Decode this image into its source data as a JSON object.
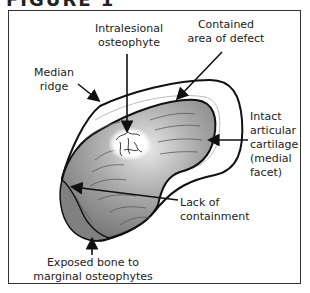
{
  "figure": {
    "title": "FIGURE 1"
  },
  "labels": {
    "intralesional": "Intralesional\nosteophyte",
    "contained": "Contained\narea of defect",
    "median_ridge": "Median\nridge",
    "intact_cartilage": "Intact\narticular\ncartilage\n(medial\nfacet)",
    "lack_containment": "Lack of\ncontainment",
    "exposed_bone": "Exposed bone to\nmarginal osteophytes"
  },
  "colors": {
    "outline": "#111111",
    "defect_dark": "#7a7a7a",
    "defect_light": "#d8d8d8",
    "osteophyte": "#ffffff"
  }
}
